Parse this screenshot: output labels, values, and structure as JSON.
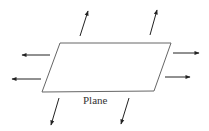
{
  "diagram": {
    "label": "Plane",
    "colors": {
      "stroke": "#555555",
      "arrow": "#222222",
      "text": "#333333"
    },
    "plane": {
      "points": [
        [
          60,
          43
        ],
        [
          171,
          43
        ],
        [
          154,
          91
        ],
        [
          42,
          92
        ]
      ]
    },
    "arrows": [
      {
        "name": "arrow-up-left",
        "from": [
          80,
          36
        ],
        "to": [
          88,
          11
        ]
      },
      {
        "name": "arrow-up-right",
        "from": [
          150,
          35
        ],
        "to": [
          157,
          10
        ]
      },
      {
        "name": "arrow-left-upper",
        "from": [
          50,
          55
        ],
        "to": [
          22,
          55
        ]
      },
      {
        "name": "arrow-left-lower",
        "from": [
          41,
          79
        ],
        "to": [
          12,
          79
        ]
      },
      {
        "name": "arrow-right-upper",
        "from": [
          173,
          53
        ],
        "to": [
          199,
          53
        ]
      },
      {
        "name": "arrow-right-lower",
        "from": [
          165,
          77
        ],
        "to": [
          190,
          77
        ]
      },
      {
        "name": "arrow-down-left",
        "from": [
          59,
          98
        ],
        "to": [
          51,
          125
        ]
      },
      {
        "name": "arrow-down-right",
        "from": [
          129,
          98
        ],
        "to": [
          121,
          124
        ]
      }
    ]
  }
}
